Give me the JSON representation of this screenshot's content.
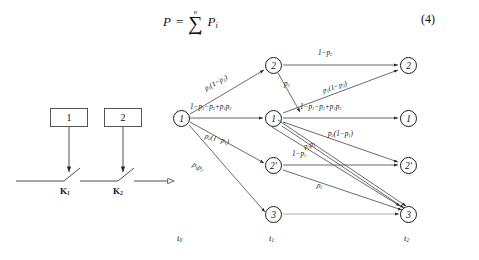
{
  "equation": {
    "lhs": "P",
    "eq": "=",
    "sigma_upper": "n",
    "sigma_glyph": "∑",
    "sigma_lower": "i = 1",
    "summand": "P",
    "summand_sub": "i",
    "number": "(4)"
  },
  "circuit": {
    "box1": "1",
    "box2": "2",
    "switch1": "K",
    "switch1_sub": "1",
    "switch2": "K",
    "switch2_sub": "2"
  },
  "trellis": {
    "time_labels": [
      {
        "text": "t",
        "sub": "0"
      },
      {
        "text": "t",
        "sub": "1"
      },
      {
        "text": "t",
        "sub": "2"
      }
    ],
    "nodes": {
      "t0": [
        {
          "id": "n0_1",
          "label": "1"
        }
      ],
      "t1": [
        {
          "id": "n1_2",
          "label": "2"
        },
        {
          "id": "n1_1",
          "label": "1"
        },
        {
          "id": "n1_2p",
          "label": "2'"
        },
        {
          "id": "n1_3",
          "label": "3"
        }
      ],
      "t2": [
        {
          "id": "n2_2",
          "label": "2"
        },
        {
          "id": "n2_1",
          "label": "1"
        },
        {
          "id": "n2_2p",
          "label": "2'"
        },
        {
          "id": "n2_3",
          "label": "3"
        }
      ]
    },
    "edge_labels": [
      {
        "id": "e_t0_2",
        "html": "p<sub>1</sub>(1−p<sub>2</sub>)"
      },
      {
        "id": "e_t0_1",
        "html": "1−p<sub>1</sub>−p<sub>2</sub>+p<sub>1</sub>p<sub>2</sub>"
      },
      {
        "id": "e_t0_2p",
        "html": "p<sub>2</sub>(1−p<sub>1</sub>)"
      },
      {
        "id": "e_t0_3",
        "html": "p<sub>1</sub>p<sub>2</sub>"
      },
      {
        "id": "e_22",
        "html": "1−p<sub>2</sub>"
      },
      {
        "id": "e_2_down",
        "html": "p<sub>2</sub>"
      },
      {
        "id": "e_1_up2",
        "html": "p<sub>1</sub>(1−p<sub>2</sub>)"
      },
      {
        "id": "e_11",
        "html": "1−p<sub>1</sub>−p<sub>2</sub>+p<sub>1</sub>p<sub>2</sub>"
      },
      {
        "id": "e_1_2p",
        "html": "p<sub>2</sub>(1−p<sub>1</sub>)"
      },
      {
        "id": "e_1_3",
        "html": "p<sub>1</sub>p<sub>2</sub>"
      },
      {
        "id": "e_2p2p",
        "html": "1−p<sub>1</sub>"
      },
      {
        "id": "e_2p_3",
        "html": "p<sub>1</sub>"
      }
    ]
  },
  "colors": {
    "ink": "#1a1a1a",
    "line": "#3a3a3a",
    "box": "#555555",
    "background": "#ffffff"
  }
}
